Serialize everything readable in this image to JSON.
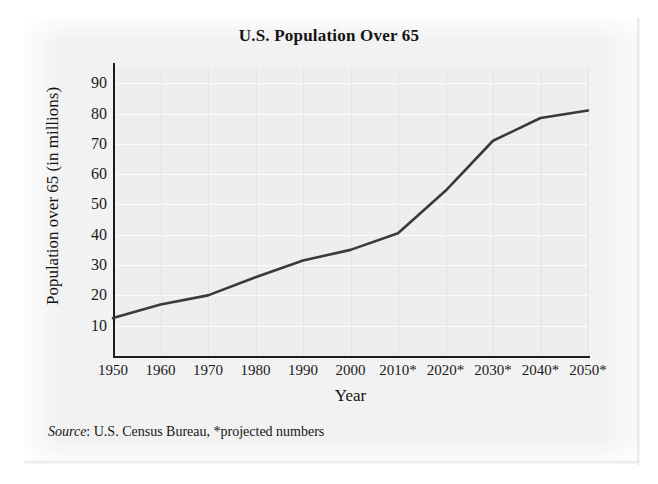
{
  "chart_data": {
    "type": "line",
    "title": "U.S. Population Over 65",
    "xlabel": "Year",
    "ylabel": "Population over 65 (in millions)",
    "source_note_italic": "Source",
    "source_note_rest": ": U.S. Census Bureau, *projected numbers",
    "categories": [
      "1950",
      "1960",
      "1970",
      "1980",
      "1990",
      "2000",
      "2010*",
      "2020*",
      "2030*",
      "2040*",
      "2050*"
    ],
    "x": [
      1950,
      1960,
      1970,
      1980,
      1990,
      2000,
      2010,
      2020,
      2030,
      2040,
      2050
    ],
    "values": [
      12.5,
      17,
      20,
      26,
      31.5,
      35,
      40.5,
      54.5,
      71,
      78.5,
      81
    ],
    "xlim": [
      1950,
      2050
    ],
    "ylim": [
      0,
      95
    ],
    "yticks": [
      90,
      80,
      70,
      60,
      50,
      40,
      30,
      20,
      10
    ],
    "grid": true,
    "legend": "none",
    "line_color": "#3a3a3a",
    "plot_background": "#eeeeee",
    "axis_color": "#1c1c1c"
  }
}
